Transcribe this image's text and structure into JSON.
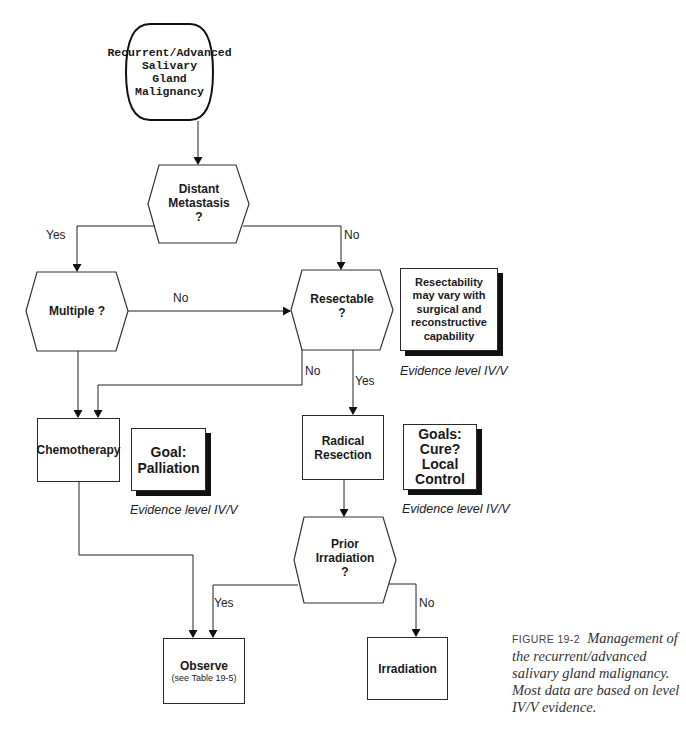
{
  "diagram": {
    "start": {
      "lines": [
        "Recurrent/Advanced",
        "Salivary",
        "Gland",
        "Malignancy"
      ]
    },
    "decisions": {
      "distant_metastasis": {
        "lines": [
          "Distant",
          "Metastasis",
          "?"
        ]
      },
      "multiple": {
        "lines": [
          "Multiple ?"
        ]
      },
      "resectable": {
        "lines": [
          "Resectable",
          "?"
        ]
      },
      "prior_irradiation": {
        "lines": [
          "Prior",
          "Irradiation",
          "?"
        ]
      }
    },
    "actions": {
      "chemotherapy": {
        "label": "Chemotherapy"
      },
      "radical_resection": {
        "lines": [
          "Radical",
          "Resection"
        ]
      },
      "observe": {
        "label": "Observe",
        "sub": "(see Table 19-5)"
      },
      "irradiation": {
        "label": "Irradiation"
      }
    },
    "notes": {
      "resectability": {
        "lines": [
          "Resectability",
          "may vary with",
          "surgical and",
          "reconstructive",
          "capability"
        ],
        "evidence": "Evidence level IV/V"
      },
      "palliation": {
        "lines": [
          "Goal:",
          "Palliation"
        ],
        "evidence": "Evidence level IV/V"
      },
      "cure": {
        "lines": [
          "Goals:",
          "Cure?",
          "Local",
          "Control"
        ],
        "evidence": "Evidence level IV/V"
      }
    },
    "edge_labels": {
      "metastasis_yes": "Yes",
      "metastasis_no": "No",
      "multiple_no": "No",
      "resectable_no": "No",
      "resectable_yes": "Yes",
      "irradiation_yes": "Yes",
      "irradiation_no": "No"
    }
  },
  "caption": {
    "figure_label": "FIGURE 19-2",
    "text": "Management of the recurrent/advanced salivary gland malignancy. Most data are based on level IV/V evidence."
  }
}
